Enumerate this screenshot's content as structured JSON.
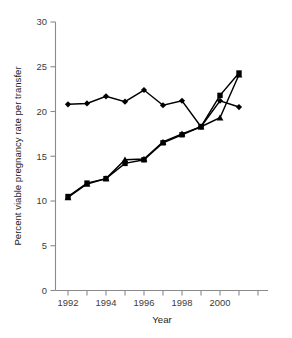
{
  "chart_data": {
    "type": "line",
    "title": "",
    "xlabel": "Year",
    "ylabel": "Percent viable pregnancy rate per transfer",
    "x": [
      1992,
      1993,
      1994,
      1995,
      1996,
      1997,
      1998,
      1999,
      2000,
      2001
    ],
    "xlim": [
      1991.5,
      2002.0
    ],
    "ylim": [
      0,
      30
    ],
    "xticks": [
      1992,
      1993,
      1994,
      1995,
      1996,
      1997,
      1998,
      1999,
      2000,
      2001,
      2002
    ],
    "xtick_labels": [
      "1992",
      "",
      "1994",
      "",
      "1996",
      "",
      "1998",
      "",
      "2000",
      "",
      ""
    ],
    "yticks": [
      0,
      5,
      10,
      15,
      20,
      25,
      30
    ],
    "ytick_labels": [
      "0",
      "5",
      "10",
      "15",
      "20",
      "25",
      "30"
    ],
    "grid": false,
    "legend": "none",
    "series": [
      {
        "name": "series-diamond",
        "marker": "diamond",
        "color": "#000000",
        "values": [
          20.8,
          20.9,
          21.7,
          21.1,
          22.4,
          20.7,
          21.2,
          18.3,
          21.2,
          20.5
        ]
      },
      {
        "name": "series-square",
        "marker": "square",
        "color": "#000000",
        "values": [
          10.5,
          12.0,
          12.5,
          14.2,
          14.6,
          16.5,
          17.4,
          18.3,
          21.8,
          24.3
        ]
      },
      {
        "name": "series-triangle",
        "marker": "triangle",
        "color": "#000000",
        "values": [
          10.4,
          11.9,
          12.5,
          14.6,
          14.7,
          16.6,
          17.5,
          18.3,
          19.3,
          24.1
        ]
      }
    ]
  }
}
